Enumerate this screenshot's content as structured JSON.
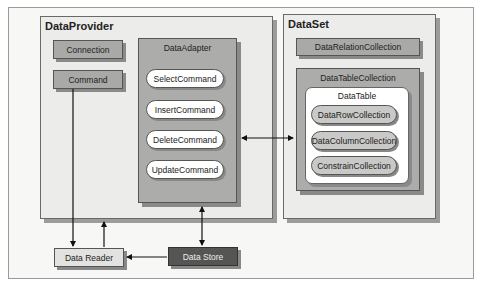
{
  "diagram": {
    "data_provider": {
      "title": "DataProvider",
      "connection": "Connection",
      "command": "Command",
      "data_adapter": {
        "title": "DataAdapter",
        "commands": [
          "SelectCommand",
          "InsertCommand",
          "DeleteCommand",
          "UpdateCommand"
        ]
      }
    },
    "data_set": {
      "title": "DataSet",
      "relation_collection": "DataRelationCollection",
      "table_collection": {
        "title": "DataTableCollection",
        "data_table": {
          "title": "DataTable",
          "collections": [
            "DataRowCollection",
            "DataColumnCollection",
            "ConstrainCollection"
          ]
        }
      }
    },
    "data_reader": "Data Reader",
    "data_store": "Data Store",
    "connections": [
      {
        "from": "DataAdapter",
        "to": "DataSet",
        "type": "bidirectional"
      },
      {
        "from": "Command",
        "to": "Data Reader",
        "type": "arrow"
      },
      {
        "from": "Data Reader",
        "to": "DataProvider",
        "type": "arrow"
      },
      {
        "from": "DataAdapter",
        "to": "Data Store",
        "type": "bidirectional"
      },
      {
        "from": "Data Store",
        "to": "Data Reader",
        "type": "arrow"
      }
    ],
    "colors": {
      "panel": "#ececea",
      "box": "#a9a9a7",
      "data_store": "#555553",
      "data_reader": "#e2e2e0"
    }
  }
}
